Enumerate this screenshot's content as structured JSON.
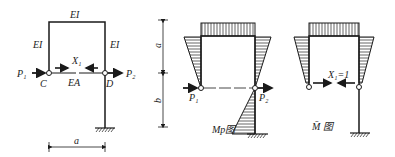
{
  "diagram_1": {
    "beam_label": "EI",
    "left_column_label": "EI",
    "right_column_label": "EI",
    "tie_label": "EA",
    "redundant_label": "X₁",
    "load_left": "P₁",
    "load_right": "P₂",
    "node_left": "C",
    "node_right": "D",
    "span_label": "a"
  },
  "diagram_2": {
    "height_top_label": "a",
    "height_bottom_label": "b",
    "load_left": "P₁",
    "load_right": "P₂",
    "caption": "Mp图"
  },
  "diagram_3": {
    "redundant_label": "X₁=1",
    "caption": "M̄ 图"
  },
  "colors": {
    "line": "#1a1a1a",
    "background": "#ffffff"
  }
}
